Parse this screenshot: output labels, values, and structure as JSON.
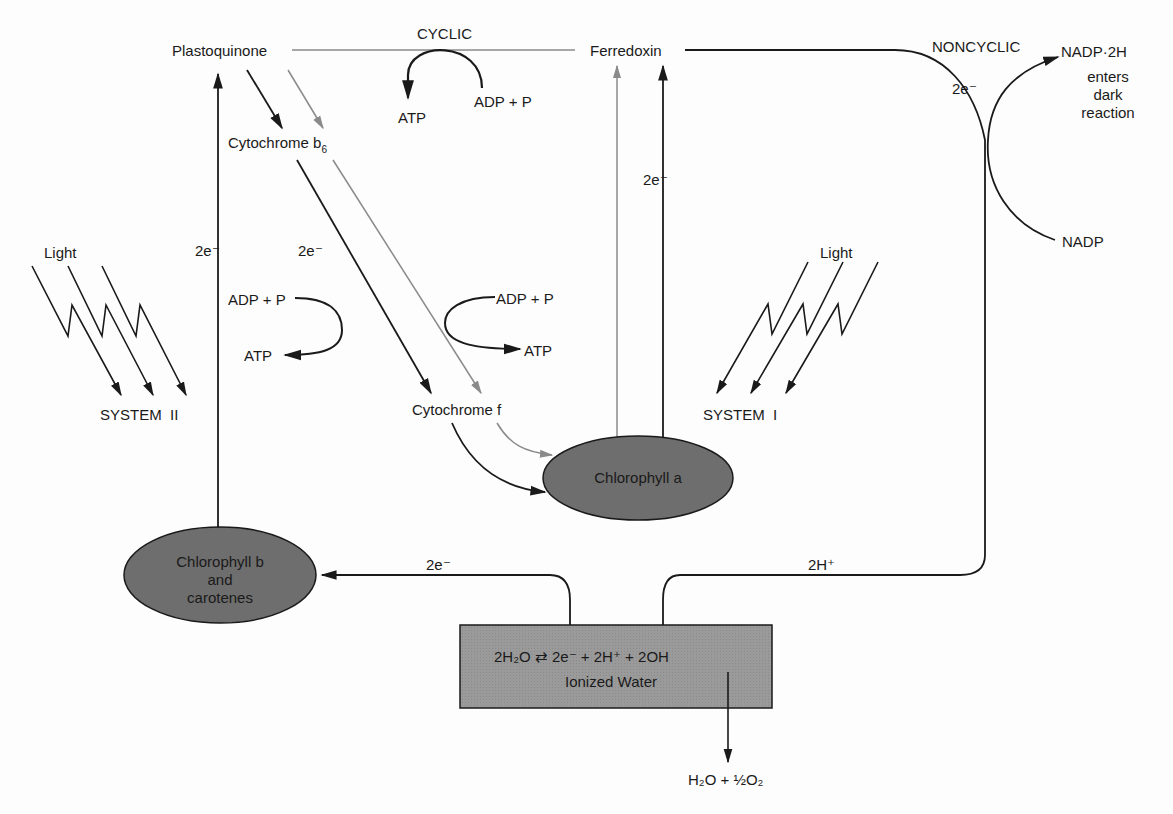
{
  "colors": {
    "ink": "#1a1a1a",
    "gray_path": "#8a8a8a",
    "node_fill": "#6e6e6e",
    "box_fill": "#9a9a9a",
    "background": "#fdfdfd"
  },
  "labels": {
    "plastoquinone": "Plastoquinone",
    "cyclic": "CYCLIC",
    "ferredoxin": "Ferredoxin",
    "noncyclic": "NONCYCLIC",
    "nadp2h": "NADP·2H",
    "enters": "enters",
    "dark": "dark",
    "reaction": "reaction",
    "nadp": "NADP",
    "atp_top": "ATP",
    "adp_top": "ADP + P",
    "cytochrome_b6": "Cytochrome b",
    "cytochrome_b6_sub": "6",
    "two_e_noncyclic": "2e⁻",
    "two_e_ferredoxin": "2e⁻",
    "two_e_psii": "2e⁻",
    "two_e_cytb6": "2e⁻",
    "light_left": "Light",
    "light_right": "Light",
    "system_ii": "SYSTEM  II",
    "system_i": "SYSTEM  I",
    "adp_left": "ADP + P",
    "atp_left": "ATP",
    "adp_right": "ADP + P",
    "atp_right": "ATP",
    "cytochrome_f": "Cytochrome f",
    "chlorophyll_a": "Chlorophyll a",
    "chlorophyll_b_1": "Chlorophyll b",
    "chlorophyll_b_2": "and",
    "chlorophyll_b_3": "carotenes",
    "two_e_water": "2e⁻",
    "two_h_plus": "2H⁺",
    "water_equation": "2H₂O ⇄ 2e⁻ + 2H⁺ + 2OH",
    "ionized_water": "Ionized Water",
    "products": "H₂O + ½O₂"
  }
}
